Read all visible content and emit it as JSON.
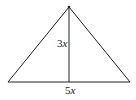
{
  "diagram": {
    "type": "triangle-with-altitude",
    "height_label_coef": "3",
    "height_label_var": "x",
    "base_label_coef": "5",
    "base_label_var": "x",
    "stroke_color": "#222222"
  }
}
